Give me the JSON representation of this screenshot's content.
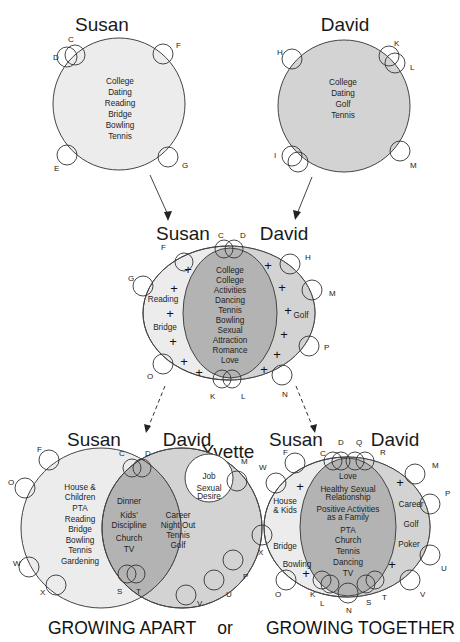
{
  "colors": {
    "susan_fill": "#ececec",
    "david_fill": "#d3d3d3",
    "shared_fill": "#b3b3b3",
    "outline": "#444444",
    "yvette_fill": "#ffffff"
  },
  "top": {
    "susan": {
      "name": "Susan",
      "items": [
        "College",
        "Dating",
        "Reading",
        "Bridge",
        "Bowling",
        "Tennis"
      ],
      "friends": [
        "C",
        "D",
        "F",
        "E",
        "G"
      ]
    },
    "david": {
      "name": "David",
      "items": [
        "College",
        "Dating",
        "Golf",
        "Tennis"
      ],
      "friends": [
        "H",
        "K",
        "L",
        "I",
        "M"
      ]
    }
  },
  "middle": {
    "left_name": "Susan",
    "right_name": "David",
    "susan_only": [
      "Reading",
      "Bridge"
    ],
    "david_only": [
      "Golf"
    ],
    "shared": [
      "College",
      "College",
      "Activities",
      "Dancing",
      "Tennis",
      "Bowling",
      "Sexual",
      "Attraction",
      "Romance",
      "Love"
    ],
    "friends": [
      "C",
      "D",
      "F",
      "G",
      "O",
      "K",
      "L",
      "N",
      "H",
      "M",
      "P"
    ],
    "plus_symbol": "+"
  },
  "apart": {
    "left_name": "Susan",
    "right_name": "David",
    "third_name": "Yvette",
    "susan_only": [
      "House &",
      "Children",
      "PTA",
      "Reading",
      "Bridge",
      "Bowling",
      "Tennis",
      "Gardening"
    ],
    "shared": [
      "Dinner",
      "Kids'",
      "Discipline",
      "Church",
      "TV"
    ],
    "david_only": [
      "Career",
      "Night Out",
      "Tennis",
      "Golf"
    ],
    "yvette_items": [
      "Job",
      "Sexual",
      "Desire"
    ],
    "friends": [
      "F",
      "O",
      "W",
      "X",
      "C",
      "D",
      "S",
      "T",
      "M",
      "P",
      "U",
      "V"
    ]
  },
  "together": {
    "left_name": "Susan",
    "right_name": "David",
    "susan_only": [
      "House",
      "& Kids",
      "Bridge",
      "Bowling"
    ],
    "shared": [
      "Love",
      "Healthy Sexual",
      "Relationship",
      "Positive Activities",
      "as a Family",
      "PTA",
      "Church",
      "Tennis",
      "Dancing",
      "TV"
    ],
    "david_only": [
      "Career",
      "Golf",
      "Poker"
    ],
    "friends": [
      "F",
      "W",
      "X",
      "O",
      "C",
      "D",
      "Q",
      "R",
      "M",
      "P",
      "U",
      "V",
      "K",
      "L",
      "N",
      "S",
      "T"
    ],
    "plus_symbol": "+"
  },
  "footer": {
    "left": "GROWING APART",
    "middle": "or",
    "right": "GROWING TOGETHER"
  }
}
